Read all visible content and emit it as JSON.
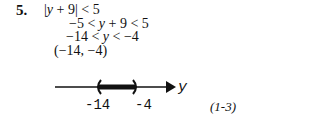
{
  "problem": {
    "number": "5.",
    "steps": [
      {
        "pre": "|",
        "var": "y",
        "post": " + 9| < 5"
      },
      {
        "pre": "−5 < ",
        "var": "y",
        "post": " + 9 < 5"
      },
      {
        "pre": "−14 < ",
        "var": "y",
        "post": " < −4"
      },
      {
        "pre": "(−14, −4)",
        "var": "",
        "post": ""
      }
    ],
    "number_line": {
      "variable": "y",
      "left_label": "-14",
      "right_label": "-4",
      "left_endpoint": "open",
      "right_endpoint": "open"
    },
    "reference": "(1-3)"
  }
}
